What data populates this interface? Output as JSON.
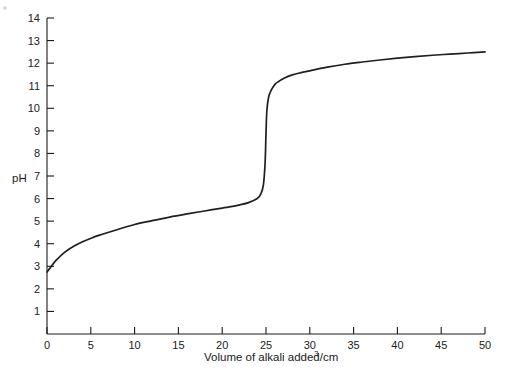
{
  "chart_data": {
    "type": "line",
    "title": "",
    "xlabel": "Volume of alkali added/cm",
    "xlabel_superscript": "3",
    "xlabel_full": "Volume of alkali added/cm3",
    "ylabel": "pH",
    "xlim": [
      0,
      50
    ],
    "ylim": [
      0,
      14
    ],
    "grid": false,
    "legend": null,
    "x_ticks": [
      0,
      5,
      10,
      15,
      20,
      25,
      30,
      35,
      40,
      45,
      50
    ],
    "x_tick_labels": [
      "0",
      "5",
      "10",
      "15",
      "20",
      "25",
      "30",
      "35",
      "40",
      "45",
      "50"
    ],
    "y_ticks": [
      1,
      2,
      3,
      4,
      5,
      6,
      7,
      8,
      9,
      10,
      11,
      12,
      13,
      14
    ],
    "y_tick_labels": [
      "1",
      "2",
      "3",
      "4",
      "5",
      "6",
      "7",
      "8",
      "9",
      "10",
      "11",
      "12",
      "13",
      "14"
    ],
    "series": [
      {
        "name": "Titration curve (weak acid with strong alkali)",
        "color": "#1f1f1f",
        "x": [
          0,
          0.5,
          1,
          2,
          3,
          4,
          5,
          6,
          8,
          10,
          12,
          14,
          16,
          18,
          20,
          21,
          22,
          23,
          24,
          24.4,
          24.7,
          24.9,
          25,
          25.1,
          25.3,
          25.6,
          26,
          26.5,
          27,
          28,
          29,
          30,
          32,
          34,
          36,
          38,
          40,
          42,
          44,
          46,
          48,
          50
        ],
        "y": [
          2.75,
          3.0,
          3.25,
          3.62,
          3.88,
          4.08,
          4.24,
          4.38,
          4.62,
          4.85,
          5.02,
          5.18,
          5.32,
          5.45,
          5.58,
          5.64,
          5.72,
          5.82,
          6.0,
          6.2,
          6.6,
          7.6,
          8.9,
          9.9,
          10.5,
          10.8,
          11.05,
          11.2,
          11.32,
          11.48,
          11.58,
          11.66,
          11.82,
          11.95,
          12.05,
          12.14,
          12.22,
          12.29,
          12.35,
          12.4,
          12.45,
          12.5
        ]
      }
    ],
    "equivalence_point": {
      "x": 25,
      "y": 8.9
    },
    "start_point": {
      "x": 0,
      "y": 2.75
    },
    "end_point": {
      "x": 50,
      "y": 12.5
    }
  },
  "axes": {
    "y_axis_label": "pH"
  }
}
